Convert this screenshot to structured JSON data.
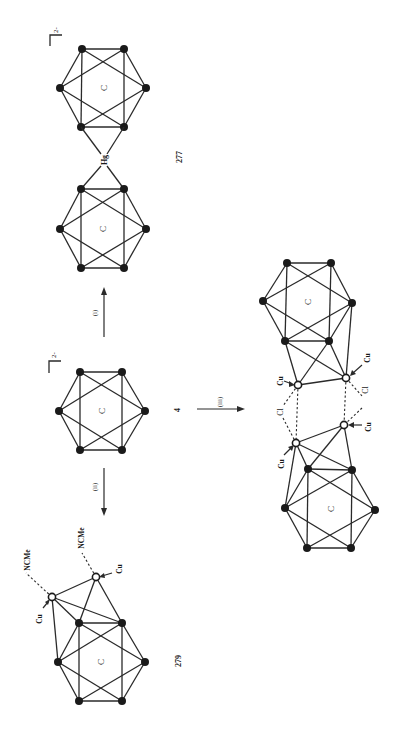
{
  "figure": {
    "orientation": "rotated-90-ccw",
    "background": "#ffffff",
    "ink_color": "#1a1a1a"
  },
  "compounds": {
    "hg_dimer": {
      "number": "277",
      "charge": "2-",
      "bridge_atom": "Hg",
      "cage_label": "C"
    },
    "anion": {
      "number": "4",
      "charge": "2-",
      "cage_label": "C"
    },
    "cu_adduct": {
      "number": "279",
      "cage_label": "C",
      "metal_labels": [
        "Cu",
        "Cu"
      ],
      "ligand_labels": [
        "NCMe",
        "NCMe"
      ]
    },
    "cl_bridged": {
      "cage_label": "C",
      "metal_labels": [
        "Cu",
        "Cu",
        "Cu",
        "Cu"
      ],
      "bridge_labels": [
        "Cl",
        "Cl"
      ]
    }
  },
  "reactions": [
    {
      "label": "(i)",
      "from": "4",
      "to": "277"
    },
    {
      "label": "(ii)",
      "from": "4",
      "to": "279"
    },
    {
      "label": "(iii)",
      "from": "4",
      "to": "cl_bridged"
    }
  ]
}
